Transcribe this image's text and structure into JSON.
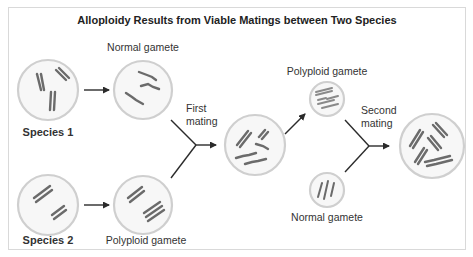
{
  "title": "Alloploidy Results from Viable Matings between Two Species",
  "nodes": {
    "species1": {
      "label": "Species 1"
    },
    "species2": {
      "label": "Species 2"
    },
    "gamete_normal_1": {
      "label": "Normal gamete"
    },
    "gamete_polyploid_1": {
      "label": "Polyploid gamete"
    },
    "hybrid": {
      "label": ""
    },
    "gamete_polyploid_2": {
      "label": "Polyploid gamete"
    },
    "gamete_normal_2": {
      "label": "Normal gamete"
    },
    "alloploid": {
      "label": ""
    }
  },
  "steps": {
    "first_mating": {
      "line1": "First",
      "line2": "mating"
    },
    "second_mating": {
      "line1": "Second",
      "line2": "mating"
    }
  },
  "colors": {
    "frame_border": "#d9d9d9",
    "cell_fill": "#f7f7f7",
    "cell_stroke": "#cfcfcf",
    "chromosome": "#6b6b6b",
    "arrow": "#2b2b2b"
  }
}
